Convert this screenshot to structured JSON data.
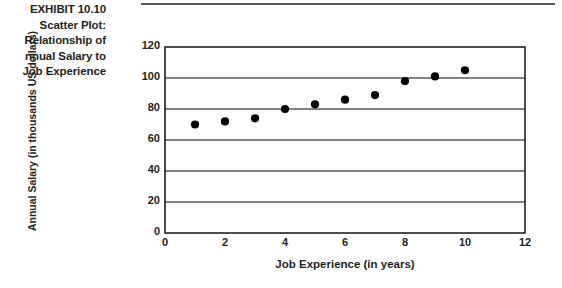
{
  "exhibit": {
    "label": "EXHIBIT 10.10",
    "caption_lines": [
      "Scatter Plot:",
      "Relationship of",
      "nnual Salary to",
      "Job Experience"
    ]
  },
  "colors": {
    "text": "#231f20",
    "rule": "#58585b",
    "gridline": "#58585b",
    "frame": "#231f20",
    "marker": "#000000"
  },
  "chart_data": {
    "type": "scatter",
    "title": "",
    "xlabel": "Job Experience (in years)",
    "ylabel": "Annual Salary (in thousands US dollars)",
    "xlim": [
      0,
      12
    ],
    "ylim": [
      0,
      120
    ],
    "xticks": [
      0,
      2,
      4,
      6,
      8,
      10,
      12
    ],
    "xticklabels": [
      "0",
      "2",
      "4",
      "6",
      "8",
      "10",
      "12"
    ],
    "yticks": [
      0,
      20,
      40,
      60,
      80,
      100,
      120
    ],
    "yticklabels": [
      "0",
      "20",
      "40",
      "60",
      "80",
      "100",
      "120"
    ],
    "grid": "horizontal",
    "legend": null,
    "series": [
      {
        "name": "Annual Salary",
        "marker": "filled-circle",
        "x": [
          1,
          2,
          3,
          4,
          5,
          6,
          7,
          8,
          9,
          10
        ],
        "y": [
          70,
          72,
          74,
          80,
          83,
          86,
          89,
          98,
          101,
          105
        ]
      }
    ]
  }
}
